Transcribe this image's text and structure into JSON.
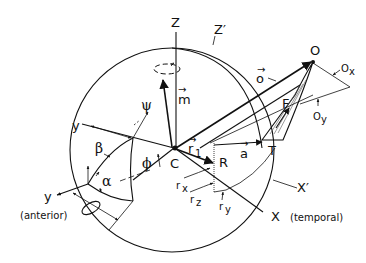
{
  "diagram": {
    "type": "eye-globe-coordinate-diagram",
    "colors": {
      "ink": "#111111",
      "background": "#ffffff"
    },
    "axes": {
      "z": "Z",
      "z_prime": "Z′",
      "x": "X",
      "x_prime": "X′",
      "y_upper": "y",
      "y_lower": "y"
    },
    "points": {
      "center": "C",
      "origin": "O",
      "tangent": "T",
      "insertion": "R",
      "muscle": "F"
    },
    "vectors": {
      "m": "m",
      "o": "o",
      "a": "a",
      "r": "r"
    },
    "angles": {
      "psi": "ψ",
      "beta": "β",
      "alpha": "α",
      "phi": "ϕ"
    },
    "components": {
      "rx": "r",
      "rx_sub": "x",
      "ry": "r",
      "ry_sub": "y",
      "rz": "r",
      "rz_sub": "z",
      "ox": "O",
      "ox_sub": "x",
      "oy": "O",
      "oy_sub": "y",
      "r_sub": "1"
    },
    "notes": {
      "anterior": "(anterior)",
      "temporal": "(temporal)"
    },
    "vector_arrow": "→"
  }
}
